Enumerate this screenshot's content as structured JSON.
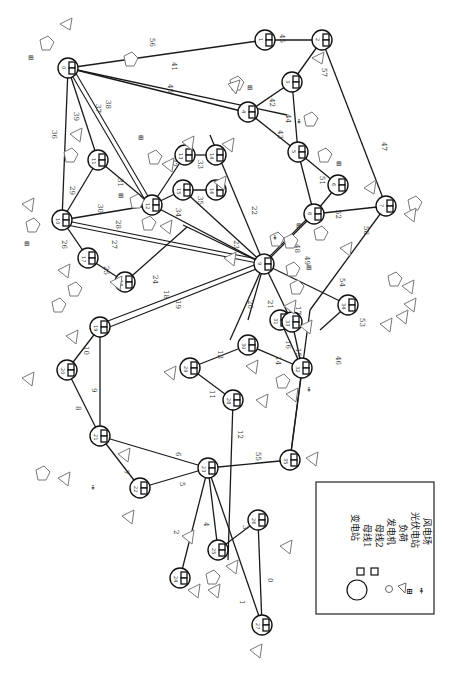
{
  "figure": {
    "rotation_deg": 90
  },
  "legend": {
    "items": [
      {
        "symbol": "circle-large",
        "label": "变电站"
      },
      {
        "symbol": "square",
        "label": "母线1"
      },
      {
        "symbol": "square",
        "label": "母线2"
      },
      {
        "symbol": "circle-small",
        "label": "发电机"
      },
      {
        "symbol": "triangle",
        "label": "负荷"
      },
      {
        "symbol": "pv-icon",
        "label": "光伏电站"
      },
      {
        "symbol": "wind-icon",
        "label": "风电场"
      }
    ]
  },
  "nodes": [
    {
      "id": "0",
      "x": 176,
      "y": 552
    },
    {
      "id": "1",
      "x": 140,
      "y": 488
    },
    {
      "id": "2",
      "x": 100,
      "y": 436
    },
    {
      "id": "3",
      "x": 218,
      "y": 550
    },
    {
      "id": "4",
      "x": 208,
      "y": 468
    },
    {
      "id": "5",
      "x": 291,
      "y": 458
    },
    {
      "id": "6",
      "x": 238,
      "y": 548
    },
    {
      "id": "7",
      "x": 260,
      "y": 625
    },
    {
      "id": "8",
      "x": 97,
      "y": 374
    },
    {
      "id": "9",
      "x": 97,
      "y": 330
    },
    {
      "id": "10",
      "x": 233,
      "y": 400
    },
    {
      "id": "11",
      "x": 190,
      "y": 368
    },
    {
      "id": "12",
      "x": 285,
      "y": 337
    },
    {
      "id": "13",
      "x": 247,
      "y": 345
    },
    {
      "id": "14",
      "x": 244,
      "y": 342
    },
    {
      "id": "15",
      "x": 279,
      "y": 319
    },
    {
      "id": "16",
      "x": 239,
      "y": 320
    },
    {
      "id": "17",
      "x": 235,
      "y": 318
    },
    {
      "id": "18",
      "x": 224,
      "y": 277
    },
    {
      "id": "19",
      "x": 225,
      "y": 231
    },
    {
      "id": "20",
      "x": 324,
      "y": 288
    },
    {
      "id": "21",
      "x": 69,
      "y": 220
    },
    {
      "id": "22",
      "x": 318,
      "y": 248
    },
    {
      "id": "23",
      "x": 96,
      "y": 160
    },
    {
      "id": "24",
      "x": 220,
      "y": 100
    },
    {
      "id": "25",
      "x": 85,
      "y": 258
    },
    {
      "id": "26",
      "x": 160,
      "y": 280
    },
    {
      "id": "27",
      "x": 184,
      "y": 230
    },
    {
      "id": "28",
      "x": 176,
      "y": 190
    },
    {
      "id": "29",
      "x": 180,
      "y": 155
    },
    {
      "id": "30",
      "x": 65,
      "y": 68
    },
    {
      "id": "31",
      "x": 185,
      "y": 112
    },
    {
      "id": "32",
      "x": 370,
      "y": 144
    },
    {
      "id": "33",
      "x": 320,
      "y": 240
    },
    {
      "id": "34",
      "x": 340,
      "y": 185
    },
    {
      "id": "35",
      "x": 367,
      "y": 304
    },
    {
      "id": "36",
      "x": 263,
      "y": 37
    },
    {
      "id": "37",
      "x": 323,
      "y": 72
    },
    {
      "id": "38",
      "x": 287,
      "y": 115
    }
  ],
  "edge_labels": [
    "0",
    "1",
    "2",
    "3",
    "4",
    "5",
    "6",
    "7",
    "8",
    "9",
    "10",
    "11",
    "12",
    "13",
    "14",
    "15",
    "16",
    "17",
    "18",
    "19",
    "20",
    "21",
    "22",
    "23",
    "24",
    "25",
    "26",
    "27",
    "28",
    "29",
    "30",
    "31",
    "32",
    "33",
    "34",
    "35",
    "36",
    "37",
    "38",
    "39",
    "40",
    "41",
    "42",
    "43",
    "44",
    "45",
    "46",
    "47",
    "48",
    "49",
    "50",
    "51",
    "52",
    "53",
    "54",
    "55",
    "56",
    "57",
    "58"
  ]
}
